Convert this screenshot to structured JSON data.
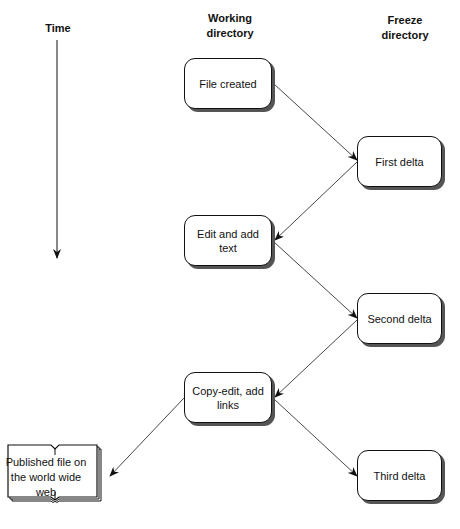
{
  "headers": {
    "time": "Time",
    "working": [
      "Working",
      "directory"
    ],
    "freeze": [
      "Freeze",
      "directory"
    ]
  },
  "nodes": {
    "file_created": "File created",
    "first_delta": "First delta",
    "edit_add_text": [
      "Edit and add",
      "text"
    ],
    "second_delta": "Second delta",
    "copy_edit": [
      "Copy-edit, add",
      "links"
    ],
    "third_delta": "Third delta",
    "published": [
      "Published file on",
      "the world wide",
      "web"
    ]
  },
  "edges": [
    {
      "from": "file_created",
      "to": "first_delta"
    },
    {
      "from": "first_delta",
      "to": "edit_add_text"
    },
    {
      "from": "edit_add_text",
      "to": "second_delta"
    },
    {
      "from": "second_delta",
      "to": "copy_edit"
    },
    {
      "from": "copy_edit",
      "to": "third_delta"
    },
    {
      "from": "copy_edit",
      "to": "published"
    }
  ]
}
